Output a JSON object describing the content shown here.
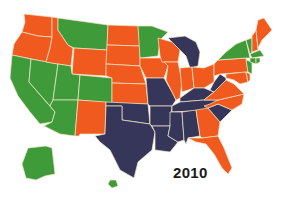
{
  "map": {
    "title": "2010",
    "colors": {
      "green": "#3f9a3a",
      "orange": "#f05a1e",
      "navy": "#35365a"
    },
    "states": {
      "WA": "orange",
      "OR": "orange",
      "CA": "green",
      "NV": "green",
      "ID": "orange",
      "MT": "green",
      "WY": "orange",
      "UT": "green",
      "AZ": "green",
      "CO": "green",
      "NM": "orange",
      "ND": "orange",
      "SD": "orange",
      "NE": "orange",
      "KS": "orange",
      "OK": "navy",
      "TX": "navy",
      "MN": "green",
      "IA": "orange",
      "MO": "navy",
      "AR": "navy",
      "LA": "navy",
      "WI": "orange",
      "IL": "orange",
      "MI": "navy",
      "IN": "orange",
      "OH": "orange",
      "KY": "navy",
      "TN": "navy",
      "MS": "navy",
      "AL": "navy",
      "GA": "orange",
      "FL": "orange",
      "SC": "navy",
      "NC": "orange",
      "VA": "orange",
      "WV": "navy",
      "PA": "orange",
      "NY": "green",
      "VT": "green",
      "NH": "orange",
      "ME": "orange",
      "MA": "green",
      "CT": "green",
      "RI": "green",
      "NJ": "green",
      "DE": "orange",
      "MD": "orange",
      "AK": "green",
      "HI": "green"
    }
  }
}
